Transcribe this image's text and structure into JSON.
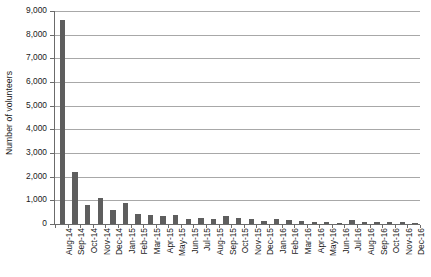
{
  "chart_data": {
    "type": "bar",
    "title": "",
    "xlabel": "",
    "ylabel": "Number of volunteers",
    "ylim": [
      0,
      9000
    ],
    "ytick_step": 1000,
    "yticks": [
      "0",
      "1,000",
      "2,000",
      "3,000",
      "4,000",
      "5,000",
      "6,000",
      "7,000",
      "8,000",
      "9,000"
    ],
    "grid": true,
    "legend": "none",
    "bar_color": "#5e5e5e",
    "gridline_color": "#a8a8a8",
    "axis_color": "#6b6b6b",
    "categories": [
      "Aug-14",
      "Sep-14",
      "Oct-14",
      "Nov-14",
      "Dec-14",
      "Jan-15",
      "Feb-15",
      "Mar-15",
      "Apr-15",
      "May-15",
      "Jun-15",
      "Jul-15",
      "Aug-15",
      "Sep-15",
      "Oct-15",
      "Nov-15",
      "Dec-15",
      "Jan-16",
      "Feb-16",
      "Mar-16",
      "Apr-16",
      "May-16",
      "Jun-16",
      "Jul-16",
      "Aug-16",
      "Sep-16",
      "Oct-16",
      "Nov-16",
      "Dec-16"
    ],
    "values": [
      8600,
      2200,
      800,
      1100,
      600,
      900,
      420,
      390,
      330,
      370,
      220,
      260,
      230,
      330,
      260,
      230,
      120,
      210,
      180,
      130,
      90,
      70,
      60,
      150,
      100,
      90,
      80,
      70,
      60
    ]
  }
}
